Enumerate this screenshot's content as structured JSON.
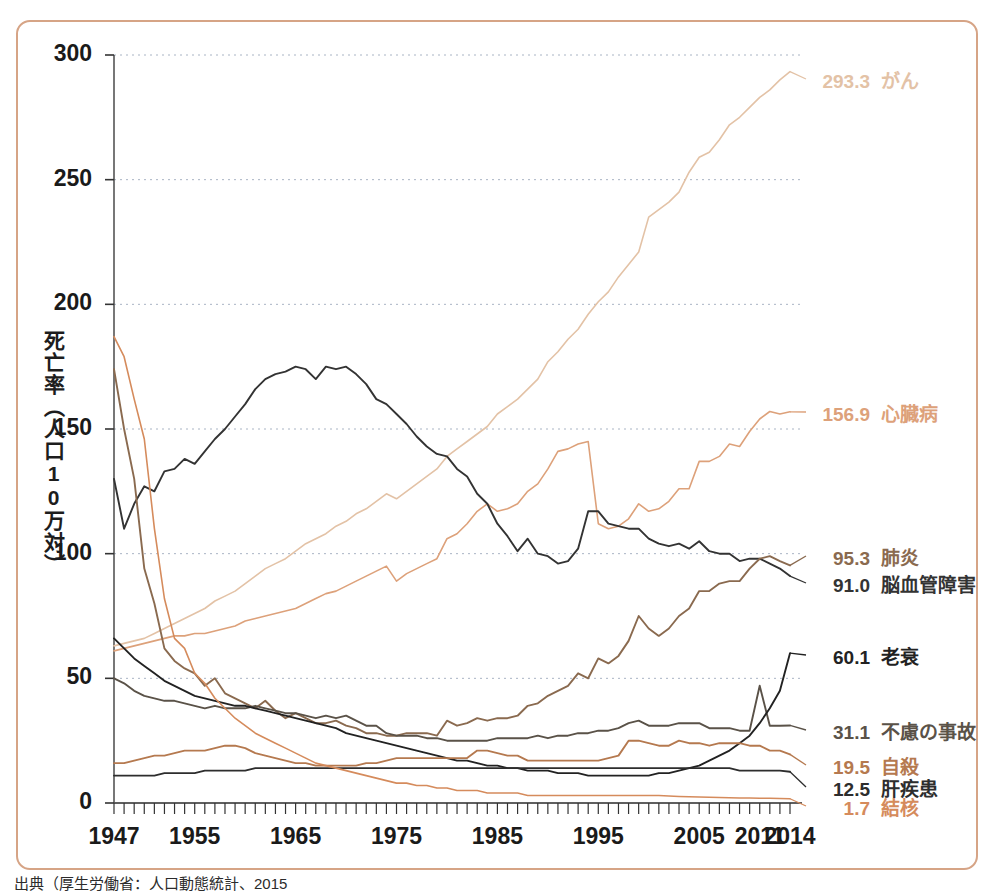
{
  "figure": {
    "border_color": "#d6a486",
    "background": "#ffffff",
    "caption": "出典（厚生労働省：人口動態統計、2015"
  },
  "axes": {
    "ylabel": "死亡率（人口10万対）",
    "yticks": [
      "0",
      "50",
      "100",
      "150",
      "200",
      "250",
      "300"
    ],
    "xticks": [
      "1947",
      "1955",
      "1965",
      "1975",
      "1985",
      "1995",
      "2005",
      "2011",
      "2014"
    ],
    "ylim": [
      0,
      300
    ],
    "xlim": [
      1947,
      2014
    ],
    "grid": "horizontal-dotted"
  },
  "labels": [
    {
      "value": "293.3",
      "name": "がん",
      "color": "#e3c2a6"
    },
    {
      "value": "156.9",
      "name": "心臓病",
      "color": "#dda17a"
    },
    {
      "value": "95.3",
      "name": "肺炎",
      "color": "#8a6a4f"
    },
    {
      "value": "91.0",
      "name": "脳血管障害",
      "color": "#333333"
    },
    {
      "value": "60.1",
      "name": "老衰",
      "color": "#222222"
    },
    {
      "value": "31.1",
      "name": "不慮の事故",
      "color": "#5a5248"
    },
    {
      "value": "19.5",
      "name": "自殺",
      "color": "#b5794f"
    },
    {
      "value": "12.5",
      "name": "肝疾患",
      "color": "#2d2d2d"
    },
    {
      "value": "1.7",
      "name": "結核",
      "color": "#d58b5c"
    }
  ],
  "chart_data": {
    "type": "line",
    "title": "",
    "xlabel": "",
    "ylabel": "死亡率（人口10万対）",
    "xlim": [
      1947,
      2014
    ],
    "ylim": [
      0,
      300
    ],
    "x": [
      1947,
      1948,
      1949,
      1950,
      1951,
      1952,
      1953,
      1954,
      1955,
      1956,
      1957,
      1958,
      1959,
      1960,
      1961,
      1962,
      1963,
      1964,
      1965,
      1966,
      1967,
      1968,
      1969,
      1970,
      1971,
      1972,
      1973,
      1974,
      1975,
      1976,
      1977,
      1978,
      1979,
      1980,
      1981,
      1982,
      1983,
      1984,
      1985,
      1986,
      1987,
      1988,
      1989,
      1990,
      1991,
      1992,
      1993,
      1994,
      1995,
      1996,
      1997,
      1998,
      1999,
      2000,
      2001,
      2002,
      2003,
      2004,
      2005,
      2006,
      2007,
      2008,
      2009,
      2010,
      2011,
      2012,
      2013,
      2014
    ],
    "series": [
      {
        "name": "がん",
        "color": "#e3c2a6",
        "end_value": 293.3,
        "values": [
          63,
          64,
          65,
          66,
          68,
          70,
          72,
          74,
          76,
          78,
          81,
          83,
          85,
          88,
          91,
          94,
          96,
          98,
          101,
          104,
          106,
          108,
          111,
          113,
          116,
          118,
          121,
          124,
          122,
          125,
          128,
          131,
          134,
          139,
          142,
          145,
          148,
          151,
          156,
          159,
          162,
          166,
          170,
          177,
          181,
          186,
          190,
          196,
          201,
          205,
          211,
          216,
          221,
          235,
          238,
          241,
          245,
          253,
          259,
          261,
          266,
          272,
          275,
          279,
          283,
          286,
          290,
          293.3
        ]
      },
      {
        "name": "心臓病",
        "color": "#dda17a",
        "end_value": 156.9,
        "values": [
          61,
          62,
          63,
          64,
          65,
          66,
          67,
          67,
          68,
          68,
          69,
          70,
          71,
          73,
          74,
          75,
          76,
          77,
          78,
          80,
          82,
          84,
          85,
          87,
          89,
          91,
          93,
          95,
          89,
          92,
          94,
          96,
          98,
          106,
          108,
          112,
          117,
          120,
          117,
          118,
          120,
          125,
          128,
          134,
          141,
          142,
          144,
          145,
          112,
          110,
          111,
          114,
          120,
          117,
          118,
          121,
          126,
          126,
          137,
          137,
          139,
          144,
          143,
          149,
          154,
          157,
          156,
          156.9
        ]
      },
      {
        "name": "脳血管障害",
        "color": "#333333",
        "end_value": 91.0,
        "values": [
          130,
          110,
          120,
          127,
          125,
          133,
          134,
          138,
          136,
          141,
          146,
          150,
          155,
          160,
          166,
          170,
          172,
          173,
          175,
          174,
          170,
          175,
          174,
          175,
          172,
          168,
          162,
          160,
          156,
          152,
          147,
          143,
          140,
          139,
          134,
          131,
          124,
          120,
          112,
          107,
          101,
          106,
          100,
          99,
          96,
          97,
          102,
          117,
          117,
          112,
          111,
          110,
          110,
          106,
          104,
          103,
          104,
          102,
          105,
          101,
          100,
          100,
          97,
          98,
          98,
          96,
          94,
          91.0
        ]
      },
      {
        "name": "肺炎",
        "color": "#8a6a4f",
        "end_value": 95.3,
        "values": [
          174,
          150,
          130,
          94,
          80,
          62,
          57,
          54,
          52,
          47,
          50,
          44,
          42,
          40,
          38,
          41,
          37,
          34,
          36,
          34,
          32,
          32,
          33,
          31,
          30,
          28,
          28,
          27,
          27,
          28,
          28,
          28,
          27,
          33,
          31,
          32,
          34,
          33,
          34,
          34,
          35,
          39,
          40,
          43,
          45,
          47,
          52,
          50,
          58,
          56,
          59,
          65,
          75,
          70,
          67,
          70,
          75,
          78,
          85,
          85,
          88,
          89,
          89,
          94,
          98,
          99,
          97,
          95.3
        ]
      },
      {
        "name": "不慮の事故",
        "color": "#5a5248",
        "end_value": 31.1,
        "values": [
          50,
          48,
          45,
          43,
          42,
          41,
          41,
          40,
          39,
          38,
          39,
          38,
          38,
          38,
          39,
          38,
          37,
          36,
          36,
          35,
          34,
          35,
          34,
          35,
          33,
          31,
          31,
          28,
          27,
          27,
          27,
          26,
          26,
          25,
          25,
          25,
          25,
          25,
          26,
          26,
          26,
          26,
          27,
          26,
          27,
          27,
          28,
          28,
          29,
          29,
          30,
          32,
          33,
          31,
          31,
          31,
          32,
          32,
          32,
          30,
          30,
          30,
          29,
          29,
          47,
          31,
          31,
          31.1
        ]
      },
      {
        "name": "老衰",
        "color": "#222222",
        "end_value": 60.1,
        "values": [
          66,
          62,
          58,
          55,
          52,
          49,
          47,
          45,
          43,
          42,
          41,
          40,
          39,
          39,
          38,
          37,
          36,
          35,
          34,
          33,
          32,
          31,
          30,
          28,
          27,
          26,
          25,
          24,
          23,
          22,
          21,
          20,
          19,
          18,
          17,
          17,
          16,
          15,
          15,
          14,
          14,
          13,
          13,
          13,
          12,
          12,
          12,
          11,
          11,
          11,
          11,
          11,
          11,
          11,
          12,
          12,
          13,
          14,
          15,
          17,
          19,
          21,
          24,
          27,
          32,
          38,
          45,
          60.1
        ]
      },
      {
        "name": "自殺",
        "color": "#b5794f",
        "end_value": 19.5,
        "values": [
          16,
          16,
          17,
          18,
          19,
          19,
          20,
          21,
          21,
          21,
          22,
          23,
          23,
          22,
          20,
          19,
          18,
          17,
          16,
          16,
          15,
          15,
          15,
          15,
          15,
          16,
          16,
          17,
          18,
          18,
          18,
          18,
          18,
          18,
          18,
          18,
          21,
          21,
          20,
          19,
          19,
          17,
          17,
          17,
          17,
          17,
          17,
          17,
          17,
          18,
          19,
          25,
          25,
          24,
          23,
          23,
          25,
          24,
          24,
          23,
          24,
          24,
          24,
          23,
          23,
          21,
          21,
          19.5
        ]
      },
      {
        "name": "肝疾患",
        "color": "#2d2d2d",
        "end_value": 12.5,
        "values": [
          11,
          11,
          11,
          11,
          11,
          12,
          12,
          12,
          12,
          13,
          13,
          13,
          13,
          13,
          14,
          14,
          14,
          14,
          14,
          14,
          14,
          14,
          14,
          14,
          14,
          14,
          14,
          14,
          14,
          14,
          14,
          14,
          14,
          14,
          14,
          14,
          14,
          14,
          14,
          14,
          14,
          14,
          14,
          14,
          14,
          14,
          14,
          14,
          14,
          14,
          14,
          14,
          14,
          14,
          14,
          14,
          14,
          14,
          14,
          14,
          14,
          14,
          13,
          13,
          13,
          13,
          13,
          12.5
        ]
      },
      {
        "name": "結核",
        "color": "#d58b5c",
        "end_value": 1.7,
        "values": [
          187,
          179,
          162,
          146,
          110,
          82,
          66,
          62,
          52,
          48,
          42,
          38,
          34,
          31,
          28,
          26,
          24,
          22,
          20,
          18,
          16,
          15,
          14,
          13,
          12,
          11,
          10,
          9,
          8,
          8,
          7,
          7,
          6,
          6,
          5,
          5,
          5,
          4,
          4,
          4,
          4,
          3,
          3,
          3,
          3,
          3,
          3,
          3,
          3,
          3,
          3,
          3,
          3,
          3,
          3,
          2.8,
          2.6,
          2.5,
          2.4,
          2.3,
          2.2,
          2.1,
          2.0,
          2.0,
          1.9,
          1.9,
          1.8,
          1.7
        ]
      }
    ]
  }
}
